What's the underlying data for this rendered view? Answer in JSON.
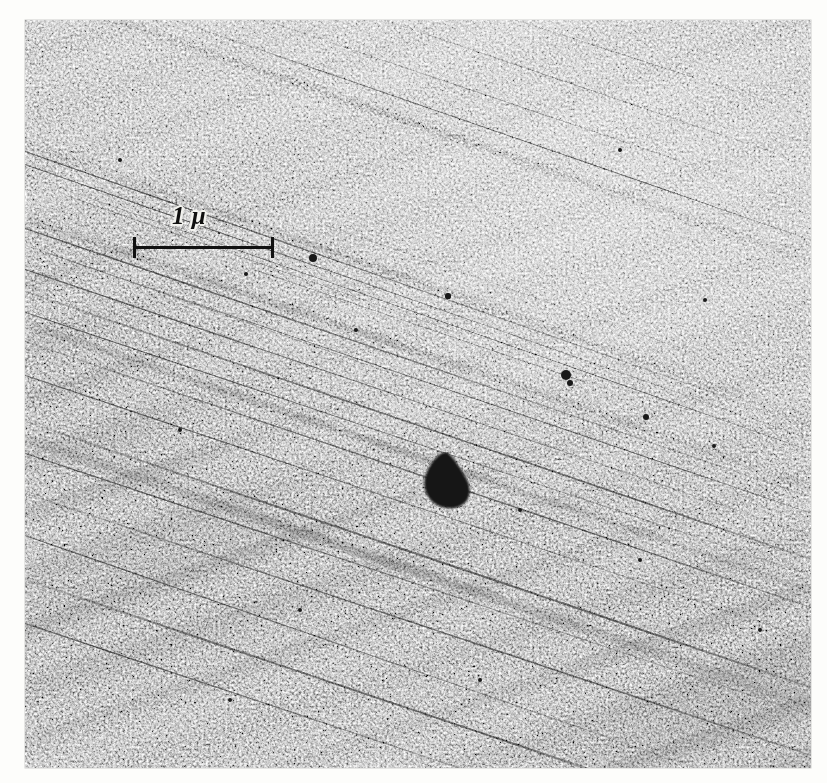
{
  "figure": {
    "kind": "electron-micrograph",
    "background_color": "#fdfdfb",
    "plate": {
      "left": 25,
      "top": 20,
      "width": 786,
      "height": 748,
      "base_gray": "#8f8f8f",
      "dark_gray": "#5a5a5a",
      "light_gray": "#c9c9c9"
    }
  },
  "scale_bar": {
    "label": "1 μ",
    "unit": "μ",
    "value": "1",
    "length_px": 141,
    "left": 133,
    "top": 237,
    "label_left": 172,
    "label_top": 203,
    "line_color": "#111111",
    "label_color": "#101010",
    "halo_color": "#f2f2ee",
    "tick_count": 2
  },
  "features": {
    "main_particle": {
      "name": "dark-precipitate-particle",
      "shape": "rounded-triangular",
      "center_x": 447,
      "center_y": 481,
      "width": 52,
      "height": 58,
      "color": "#111111"
    },
    "specks": [
      {
        "x": 313,
        "y": 258,
        "r": 4.0
      },
      {
        "x": 448,
        "y": 296,
        "r": 2.6
      },
      {
        "x": 566,
        "y": 375,
        "r": 5.2
      },
      {
        "x": 570,
        "y": 383,
        "r": 3.0
      },
      {
        "x": 646,
        "y": 417,
        "r": 3.2
      },
      {
        "x": 714,
        "y": 446,
        "r": 2.4
      },
      {
        "x": 356,
        "y": 330,
        "r": 2.2
      },
      {
        "x": 246,
        "y": 274,
        "r": 2.0
      },
      {
        "x": 520,
        "y": 510,
        "r": 2.2
      },
      {
        "x": 640,
        "y": 560,
        "r": 2.0
      },
      {
        "x": 180,
        "y": 430,
        "r": 2.0
      },
      {
        "x": 300,
        "y": 610,
        "r": 2.2
      },
      {
        "x": 705,
        "y": 300,
        "r": 2.0
      },
      {
        "x": 120,
        "y": 160,
        "r": 2.0
      },
      {
        "x": 480,
        "y": 680,
        "r": 2.2
      },
      {
        "x": 620,
        "y": 150,
        "r": 1.9
      },
      {
        "x": 760,
        "y": 630,
        "r": 2.0
      },
      {
        "x": 230,
        "y": 700,
        "r": 2.0
      }
    ],
    "slip_lines": {
      "name": "dislocation-slip-lines",
      "angle_deg": 19,
      "color": "#1d1d1d",
      "count": 14
    }
  }
}
